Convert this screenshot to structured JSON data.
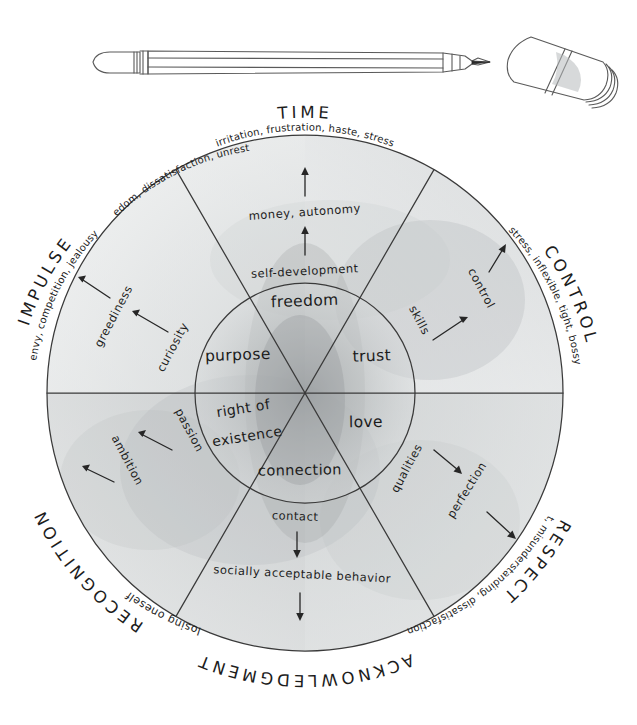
{
  "page": {
    "background_color": "#ffffff",
    "ink_color": "#2b2b2b",
    "wash_color": "#b9bcbd"
  },
  "decorations": {
    "pencil": "pencil-illustration",
    "eraser": "eraser-illustration"
  },
  "wheel": {
    "center_x": 305,
    "center_y": 393,
    "outer_radius": 258,
    "inner_radius": 110,
    "sector_count": 6,
    "axis_labels": [
      {
        "name": "time",
        "text": "TIME"
      },
      {
        "name": "control",
        "text": "CONTROL"
      },
      {
        "name": "respect",
        "text": "RESPECT"
      },
      {
        "name": "acknowledgment",
        "text": "ACKNOWLEDGMENT"
      },
      {
        "name": "recognition",
        "text": "RECOGNITION"
      },
      {
        "name": "impulse",
        "text": "IMPULSE"
      }
    ],
    "sectors": [
      {
        "name": "time",
        "axis": "TIME",
        "core": "freedom",
        "inner_term": "self-development",
        "mid_term": "money, autonomy",
        "outer_term": "irritation, frustration, haste, stress"
      },
      {
        "name": "control",
        "axis": "CONTROL",
        "core": "trust",
        "inner_term": "skills",
        "mid_term": "control",
        "outer_term": "stress, inflexible, tight, bossy"
      },
      {
        "name": "respect",
        "axis": "RESPECT",
        "core": "love",
        "inner_term": "qualities",
        "mid_term": "perfection",
        "outer_term": "judgment, misunderstanding, dissatisfaction"
      },
      {
        "name": "acknowledgment",
        "axis": "ACKNOWLEDGMENT",
        "core": "connection",
        "inner_term": "contact",
        "mid_term": "socially acceptable behavior",
        "outer_term": "losing oneself"
      },
      {
        "name": "recognition",
        "axis": "RECOGNITION",
        "core": "right of existence",
        "inner_term": "passion",
        "mid_term": "ambition",
        "outer_term": "envy, competition, jealousy"
      },
      {
        "name": "impulse",
        "axis": "IMPULSE",
        "core": "purpose",
        "inner_term": "curiosity",
        "mid_term": "greediness",
        "outer_term": "boredom, dissatisfaction, unrest"
      }
    ],
    "core_terms": {
      "freedom": "freedom",
      "trust": "trust",
      "love": "love",
      "connection": "connection",
      "right_of_existence_line1": "right of",
      "right_of_existence_line2": "existence",
      "purpose": "purpose"
    }
  }
}
